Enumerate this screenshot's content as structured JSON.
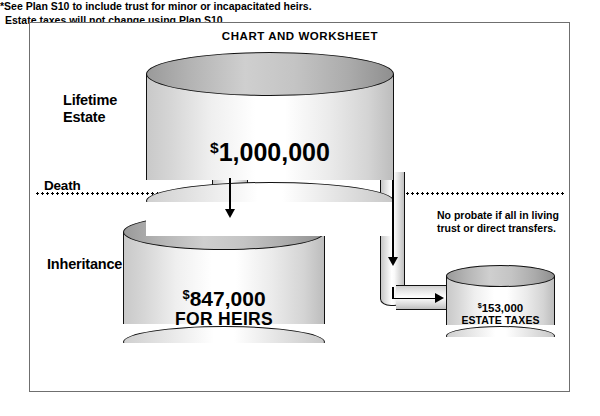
{
  "title": "CHART AND WORKSHEET",
  "labels": {
    "lifetime_line1": "Lifetime",
    "lifetime_line2": "Estate",
    "death": "Death",
    "inheritance": "Inheritance"
  },
  "annotations": {
    "probate_note": "No probate if all in living trust or direct transfers.",
    "footnote_line1": "*See Plan S10 to include trust for minor or incapacitated heirs.",
    "footnote_line2": "Estate taxes will not change using Plan S10."
  },
  "chart_data": {
    "type": "diagram-flow",
    "title": "CHART AND WORKSHEET",
    "units": "USD",
    "nodes": [
      {
        "id": "lifetime_estate",
        "label": "Lifetime Estate",
        "currency_symbol": "$",
        "amount_text": "1,000,000",
        "value": 1000000,
        "shape": "cylinder",
        "stage": "before-death"
      },
      {
        "id": "inheritance",
        "label": "Inheritance",
        "currency_symbol": "$",
        "amount_text": "847,000",
        "sub_label": "FOR HEIRS",
        "value": 847000,
        "shape": "cylinder",
        "stage": "after-death"
      },
      {
        "id": "estate_taxes",
        "label": "Estate Taxes",
        "currency_symbol": "$",
        "amount_text": "153,000",
        "sub_label": "ESTATE TAXES",
        "value": 153000,
        "shape": "cylinder",
        "stage": "after-death"
      }
    ],
    "edges": [
      {
        "from": "lifetime_estate",
        "to": "inheritance",
        "direction": "down",
        "value": 847000
      },
      {
        "from": "lifetime_estate",
        "to": "estate_taxes",
        "direction": "down-then-right",
        "value": 153000
      }
    ],
    "divider": {
      "label": "Death",
      "style": "dotted",
      "orientation": "horizontal"
    },
    "colors": {
      "stroke": "#111111",
      "frame": "#6f6f6f",
      "fill_light": "#ffffff",
      "fill_shade": "#c4c4c4",
      "text": "#000000"
    }
  }
}
